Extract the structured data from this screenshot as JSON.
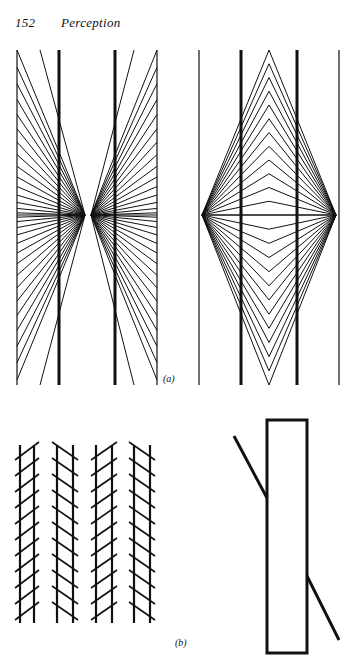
{
  "header": {
    "page_number": "152",
    "running_title": "Perception"
  },
  "figures": {
    "a": {
      "label": "(a)",
      "description": "Hering and Wundt illusions: two thick parallel vertical lines over radiating / converging line patterns"
    },
    "b": {
      "label": "(b)",
      "description": "Zöllner illusion: four pairs of parallel lines with alternating oblique hatching"
    },
    "c": {
      "description": "Poggendorff illusion: diagonal line interrupted by a tall rectangle"
    }
  },
  "colors": {
    "ink": "#111111",
    "paper": "#ffffff"
  }
}
